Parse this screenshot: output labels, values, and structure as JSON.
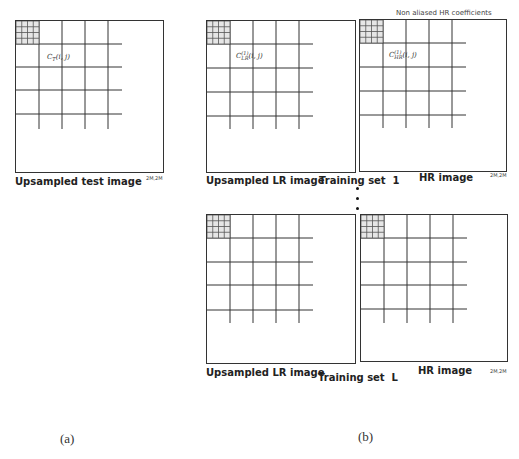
{
  "figure": {
    "panel_a": {
      "caption": "(a)",
      "image_label": "Upsampled test image",
      "size_tag": "2M,2M",
      "coefficient": {
        "base": "C",
        "sub": "T",
        "args": "(i, j)"
      }
    },
    "panel_b": {
      "caption": "(b)",
      "annotation": "Non aliased HR coefficients",
      "training_sets": [
        {
          "label": "Training set  1",
          "lr_label": "Upsampled LR image",
          "hr_label": "HR image",
          "size_tag": "2M,2M",
          "lr_coefficient": {
            "base": "C",
            "sup": "(1)",
            "sub": "LR",
            "args": "(i, j)"
          },
          "hr_coefficient": {
            "base": "C",
            "sup": "(1)",
            "sub": "HR",
            "args": "(i, j)"
          }
        },
        {
          "label": "Training set  L",
          "lr_label": "Upsampled LR image",
          "hr_label": "HR image",
          "size_tag": "2M,2M"
        }
      ],
      "ellipsis": "vertical-dots"
    }
  }
}
